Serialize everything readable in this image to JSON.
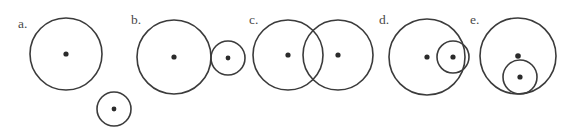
{
  "figure": {
    "background_color": "#ffffff",
    "stroke_color": "#3b3b3b",
    "dot_color": "#2b2b2b",
    "label_color": "#4a4a4a",
    "width": 570,
    "height": 132
  },
  "panels": [
    {
      "id": "a",
      "label": "a.",
      "label_x": 18,
      "label_y": 28,
      "relation": "separate",
      "circles": [
        {
          "name": "large-circle",
          "cx": 66,
          "cy": 54,
          "r": 36,
          "dot": true,
          "dot_r": 2.6
        },
        {
          "name": "small-circle",
          "cx": 114,
          "cy": 109,
          "r": 17,
          "dot": true,
          "dot_r": 2.4
        }
      ]
    },
    {
      "id": "b",
      "label": "b.",
      "label_x": 131,
      "label_y": 24,
      "relation": "externally-tangent",
      "circles": [
        {
          "name": "large-circle",
          "cx": 174,
          "cy": 57,
          "r": 37,
          "dot": true,
          "dot_r": 2.6
        },
        {
          "name": "small-circle",
          "cx": 228,
          "cy": 58,
          "r": 17,
          "dot": true,
          "dot_r": 2.4
        }
      ]
    },
    {
      "id": "c",
      "label": "c.",
      "label_x": 249,
      "label_y": 24,
      "relation": "intersecting",
      "circles": [
        {
          "name": "left-circle",
          "cx": 288,
          "cy": 55,
          "r": 35,
          "dot": true,
          "dot_r": 2.6
        },
        {
          "name": "right-circle",
          "cx": 338,
          "cy": 55,
          "r": 35,
          "dot": true,
          "dot_r": 2.6
        }
      ]
    },
    {
      "id": "d",
      "label": "d.",
      "label_x": 379,
      "label_y": 24,
      "relation": "internally-tangent",
      "circles": [
        {
          "name": "large-circle",
          "cx": 427,
          "cy": 57,
          "r": 38,
          "dot": true,
          "dot_r": 2.6
        },
        {
          "name": "inner-circle",
          "cx": 453,
          "cy": 57,
          "r": 16,
          "dot": true,
          "dot_r": 2.6
        }
      ]
    },
    {
      "id": "e",
      "label": "e.",
      "label_x": 470,
      "label_y": 24,
      "relation": "internally-contained",
      "circles": [
        {
          "name": "large-circle",
          "cx": 518,
          "cy": 56,
          "r": 38,
          "dot": true,
          "dot_r": 2.8
        },
        {
          "name": "inner-circle",
          "cx": 520,
          "cy": 77,
          "r": 17,
          "dot": true,
          "dot_r": 2.6
        }
      ]
    }
  ]
}
